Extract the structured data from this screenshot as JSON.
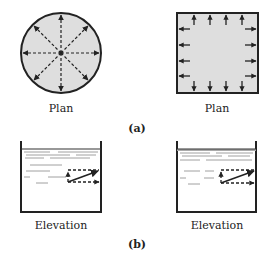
{
  "figure": {
    "part_a": {
      "label": "(a)",
      "left_panel": {
        "caption": "Plan",
        "shape": "circle",
        "arrows": "radial-outward-8"
      },
      "right_panel": {
        "caption": "Plan",
        "shape": "square",
        "arrows": "perpendicular-outward-16"
      }
    },
    "part_b": {
      "label": "(b)",
      "left_panel": {
        "caption": "Elevation",
        "shape": "tank",
        "arrows": "force-vector-resolution"
      },
      "right_panel": {
        "caption": "Elevation",
        "shape": "tank",
        "arrows": "force-vector-resolution"
      }
    }
  },
  "colors": {
    "fill": "#dedede",
    "line": "#222222"
  }
}
